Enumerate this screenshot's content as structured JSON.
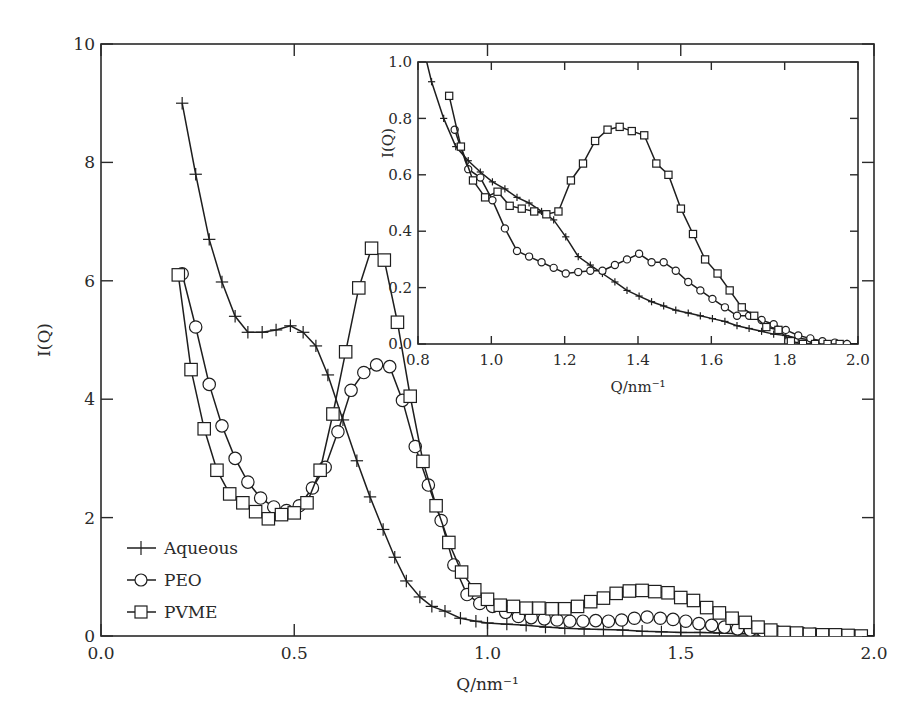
{
  "chart_data": [
    {
      "id": "main",
      "type": "line",
      "title": "",
      "xlabel": "Q/nm⁻¹",
      "ylabel": "I(Q)",
      "xlim": [
        0.0,
        2.0
      ],
      "ylim": [
        0,
        10
      ],
      "xticks": [
        "0.0",
        "0.5",
        "1.0",
        "1.5",
        "2.0"
      ],
      "xtick_values": [
        0.0,
        0.5,
        1.0,
        1.5,
        2.0
      ],
      "yticks": [
        "0",
        "2",
        "4",
        "6",
        "8",
        "10"
      ],
      "ytick_values": [
        0,
        2,
        4,
        6,
        8,
        10
      ],
      "grid": false,
      "legend_position": "lower-left",
      "legend": [
        {
          "name": "Aqueous",
          "marker": "plus"
        },
        {
          "name": "PEO",
          "marker": "circle"
        },
        {
          "name": "PVME",
          "marker": "square"
        }
      ],
      "series": [
        {
          "name": "Aqueous",
          "marker": "plus",
          "x": [
            0.21,
            0.245,
            0.28,
            0.313,
            0.347,
            0.38,
            0.417,
            0.453,
            0.49,
            0.523,
            0.556,
            0.587,
            0.626,
            0.662,
            0.696,
            0.73,
            0.76,
            0.79,
            0.825,
            0.856,
            0.89,
            0.93,
            0.97,
            1.0,
            1.05,
            1.1,
            1.15,
            1.2,
            1.25,
            1.3,
            1.35,
            1.4,
            1.45,
            1.5,
            1.55,
            1.6,
            1.65,
            1.7,
            1.75,
            1.8,
            1.85,
            1.9,
            1.95,
            2.0
          ],
          "y": [
            9.0,
            7.8,
            6.7,
            5.98,
            5.4,
            5.13,
            5.13,
            5.17,
            5.24,
            5.13,
            4.9,
            4.41,
            3.65,
            2.96,
            2.35,
            1.8,
            1.33,
            0.93,
            0.66,
            0.5,
            0.42,
            0.3,
            0.25,
            0.22,
            0.2,
            0.18,
            0.15,
            0.13,
            0.12,
            0.11,
            0.1,
            0.08,
            0.07,
            0.06,
            0.06,
            0.05,
            0.04,
            0.04,
            0.03,
            0.03,
            0.02,
            0.02,
            0.01,
            0.0
          ]
        },
        {
          "name": "PEO",
          "marker": "circle",
          "x": [
            0.21,
            0.245,
            0.28,
            0.313,
            0.347,
            0.38,
            0.413,
            0.447,
            0.48,
            0.513,
            0.547,
            0.58,
            0.613,
            0.647,
            0.68,
            0.713,
            0.747,
            0.78,
            0.813,
            0.847,
            0.88,
            0.913,
            0.947,
            0.98,
            1.013,
            1.047,
            1.08,
            1.113,
            1.147,
            1.18,
            1.213,
            1.247,
            1.28,
            1.313,
            1.347,
            1.38,
            1.413,
            1.447,
            1.48,
            1.513,
            1.547,
            1.58,
            1.613,
            1.647,
            1.68,
            1.713,
            1.747,
            1.78,
            1.813,
            1.847,
            1.88,
            1.913,
            1.947
          ],
          "y": [
            6.12,
            5.22,
            4.25,
            3.55,
            3.0,
            2.6,
            2.33,
            2.18,
            2.12,
            2.2,
            2.5,
            2.85,
            3.45,
            4.15,
            4.45,
            4.58,
            4.55,
            3.98,
            3.2,
            2.55,
            1.95,
            1.2,
            0.7,
            0.55,
            0.5,
            0.4,
            0.33,
            0.31,
            0.29,
            0.27,
            0.25,
            0.25,
            0.26,
            0.25,
            0.27,
            0.3,
            0.32,
            0.3,
            0.28,
            0.25,
            0.21,
            0.18,
            0.15,
            0.12,
            0.1,
            0.09,
            0.07,
            0.05,
            0.04,
            0.03,
            0.02,
            0.01,
            0.0
          ]
        },
        {
          "name": "PVME",
          "marker": "square",
          "x": [
            0.2,
            0.233,
            0.267,
            0.3,
            0.333,
            0.367,
            0.4,
            0.433,
            0.467,
            0.5,
            0.533,
            0.567,
            0.6,
            0.633,
            0.667,
            0.7,
            0.733,
            0.767,
            0.8,
            0.833,
            0.867,
            0.9,
            0.933,
            0.967,
            1.0,
            1.033,
            1.067,
            1.1,
            1.133,
            1.167,
            1.2,
            1.233,
            1.267,
            1.3,
            1.333,
            1.367,
            1.4,
            1.433,
            1.467,
            1.5,
            1.533,
            1.567,
            1.6,
            1.633,
            1.667,
            1.7,
            1.733,
            1.767,
            1.8,
            1.833,
            1.867,
            1.9,
            1.933,
            1.967
          ],
          "y": [
            6.1,
            4.5,
            3.5,
            2.8,
            2.4,
            2.25,
            2.1,
            1.98,
            2.05,
            2.08,
            2.25,
            2.8,
            3.75,
            4.8,
            5.88,
            6.55,
            6.35,
            5.3,
            4.05,
            2.95,
            2.2,
            1.58,
            1.08,
            0.78,
            0.62,
            0.52,
            0.5,
            0.47,
            0.47,
            0.46,
            0.46,
            0.5,
            0.58,
            0.64,
            0.72,
            0.76,
            0.77,
            0.75,
            0.73,
            0.65,
            0.6,
            0.48,
            0.39,
            0.3,
            0.23,
            0.15,
            0.1,
            0.06,
            0.05,
            0.03,
            0.02,
            0.02,
            0.01,
            0.0
          ]
        }
      ]
    },
    {
      "id": "inset",
      "type": "line",
      "title": "",
      "xlabel": "Q/nm⁻¹",
      "ylabel": "I(Q)",
      "xlim": [
        0.8,
        2.0
      ],
      "ylim": [
        0.0,
        1.0
      ],
      "xticks": [
        "0.8",
        "1.0",
        "1.2",
        "1.4",
        "1.6",
        "1.8",
        "2.0"
      ],
      "xtick_values": [
        0.8,
        1.0,
        1.2,
        1.4,
        1.6,
        1.8,
        2.0
      ],
      "yticks": [
        "0.0",
        "0.2",
        "0.4",
        "0.6",
        "0.8",
        "1.0"
      ],
      "ytick_values": [
        0.0,
        0.2,
        0.4,
        0.6,
        0.8,
        1.0
      ],
      "grid": false,
      "series": [
        {
          "name": "Aqueous",
          "marker": "plus",
          "x": [
            0.82,
            0.837,
            0.87,
            0.903,
            0.937,
            0.97,
            1.003,
            1.037,
            1.07,
            1.103,
            1.137,
            1.17,
            1.203,
            1.237,
            1.27,
            1.303,
            1.337,
            1.37,
            1.403,
            1.437,
            1.47,
            1.503,
            1.537,
            1.57,
            1.603,
            1.637,
            1.67,
            1.703,
            1.737,
            1.77,
            1.803,
            1.837,
            1.87,
            1.903,
            1.937,
            1.97,
            2.0
          ],
          "y": [
            1.02,
            0.93,
            0.8,
            0.7,
            0.65,
            0.61,
            0.575,
            0.55,
            0.52,
            0.5,
            0.47,
            0.44,
            0.38,
            0.31,
            0.28,
            0.25,
            0.22,
            0.19,
            0.17,
            0.15,
            0.135,
            0.12,
            0.11,
            0.1,
            0.09,
            0.08,
            0.065,
            0.055,
            0.045,
            0.035,
            0.03,
            0.02,
            0.015,
            0.01,
            0.005,
            0.002,
            0.0
          ]
        },
        {
          "name": "PEO",
          "marker": "circle",
          "x": [
            0.9,
            0.937,
            0.97,
            1.003,
            1.037,
            1.07,
            1.103,
            1.137,
            1.17,
            1.203,
            1.237,
            1.27,
            1.303,
            1.337,
            1.37,
            1.403,
            1.437,
            1.47,
            1.503,
            1.537,
            1.57,
            1.603,
            1.637,
            1.67,
            1.703,
            1.737,
            1.77,
            1.803,
            1.837,
            1.87,
            1.903,
            1.937,
            1.97
          ],
          "y": [
            0.76,
            0.62,
            0.59,
            0.51,
            0.41,
            0.33,
            0.31,
            0.29,
            0.27,
            0.25,
            0.255,
            0.26,
            0.26,
            0.28,
            0.3,
            0.32,
            0.29,
            0.29,
            0.26,
            0.22,
            0.19,
            0.16,
            0.13,
            0.1,
            0.1,
            0.085,
            0.07,
            0.05,
            0.03,
            0.02,
            0.01,
            0.005,
            0.0
          ]
        },
        {
          "name": "PVME",
          "marker": "square",
          "x": [
            0.885,
            0.917,
            0.95,
            0.983,
            1.017,
            1.05,
            1.083,
            1.117,
            1.15,
            1.183,
            1.217,
            1.25,
            1.283,
            1.317,
            1.35,
            1.383,
            1.417,
            1.45,
            1.483,
            1.517,
            1.55,
            1.583,
            1.617,
            1.65,
            1.683,
            1.717,
            1.75,
            1.783,
            1.817,
            1.85,
            1.883,
            1.917,
            1.95
          ],
          "y": [
            0.88,
            0.7,
            0.58,
            0.52,
            0.54,
            0.49,
            0.48,
            0.47,
            0.46,
            0.47,
            0.58,
            0.64,
            0.72,
            0.76,
            0.77,
            0.755,
            0.74,
            0.64,
            0.6,
            0.48,
            0.39,
            0.3,
            0.25,
            0.19,
            0.13,
            0.1,
            0.06,
            0.05,
            0.01,
            0.0,
            0.0,
            0.0,
            0.0
          ]
        }
      ]
    }
  ],
  "labels": {
    "main_xlabel": "Q/nm⁻¹",
    "main_ylabel": "I(Q)",
    "inset_xlabel": "Q/nm⁻¹",
    "inset_ylabel": "I(Q)",
    "legend": [
      "Aqueous",
      "PEO",
      "PVME"
    ]
  },
  "colors": {
    "ink": "#1e1e1e",
    "background": "#ffffff"
  }
}
